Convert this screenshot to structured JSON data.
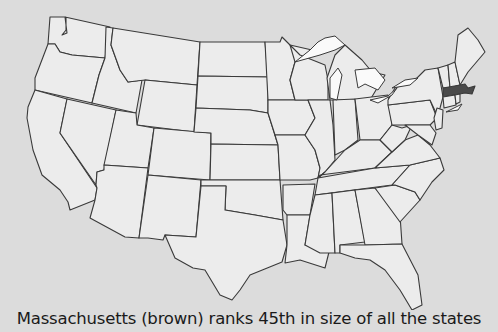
{
  "map": {
    "title": "Contiguous United States",
    "highlighted_state": "Massachusetts",
    "colors": {
      "background": "#dcdcdc",
      "state_fill": "#ececec",
      "state_stroke": "#3a3a3a",
      "highlight_fill": "#4a4a4a",
      "lakes": "#fafafa"
    }
  },
  "caption": "Massachusetts (brown) ranks 45th in size of all the states"
}
